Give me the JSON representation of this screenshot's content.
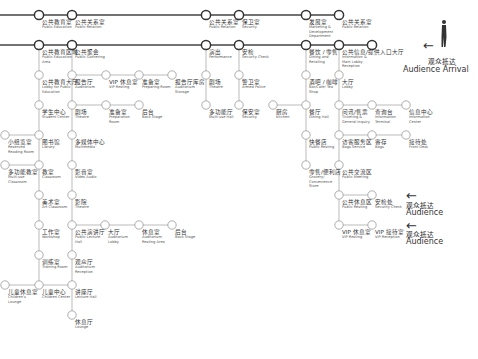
{
  "colors": {
    "main_line": "#444444",
    "branch_line": "#aaaaaa",
    "node_fill": "#ffffff"
  },
  "main_lines": [
    {
      "y": 15,
      "x1": 0,
      "x2": 339
    },
    {
      "y": 45,
      "x1": 0,
      "x2": 372
    }
  ],
  "branch_lines": [
    {
      "x1": 39,
      "y1": 45,
      "x2": 39,
      "y2": 285
    },
    {
      "x1": 72,
      "y1": 45,
      "x2": 72,
      "y2": 315
    },
    {
      "x1": 72,
      "y1": 75,
      "x2": 172,
      "y2": 75
    },
    {
      "x1": 72,
      "y1": 105,
      "x2": 139,
      "y2": 105
    },
    {
      "x1": 5,
      "y1": 135,
      "x2": 39,
      "y2": 135
    },
    {
      "x1": 5,
      "y1": 165,
      "x2": 39,
      "y2": 165
    },
    {
      "x1": 5,
      "y1": 285,
      "x2": 72,
      "y2": 285
    },
    {
      "x1": 72,
      "y1": 225,
      "x2": 172,
      "y2": 225
    },
    {
      "x1": 206,
      "y1": 45,
      "x2": 206,
      "y2": 105
    },
    {
      "x1": 239,
      "y1": 45,
      "x2": 239,
      "y2": 105
    },
    {
      "x1": 273,
      "y1": 105,
      "x2": 306,
      "y2": 105
    },
    {
      "x1": 306,
      "y1": 45,
      "x2": 306,
      "y2": 165
    },
    {
      "x1": 339,
      "y1": 45,
      "x2": 339,
      "y2": 225
    },
    {
      "x1": 339,
      "y1": 105,
      "x2": 406,
      "y2": 105
    },
    {
      "x1": 339,
      "y1": 135,
      "x2": 406,
      "y2": 135
    },
    {
      "x1": 339,
      "y1": 195,
      "x2": 372,
      "y2": 195
    },
    {
      "x1": 339,
      "y1": 225,
      "x2": 372,
      "y2": 225
    }
  ],
  "main_nodes": [
    {
      "x": 39,
      "y": 15
    },
    {
      "x": 72,
      "y": 15
    },
    {
      "x": 206,
      "y": 15
    },
    {
      "x": 239,
      "y": 15
    },
    {
      "x": 306,
      "y": 15
    },
    {
      "x": 339,
      "y": 15
    },
    {
      "x": 39,
      "y": 45
    },
    {
      "x": 72,
      "y": 45
    },
    {
      "x": 206,
      "y": 45
    },
    {
      "x": 239,
      "y": 45
    },
    {
      "x": 306,
      "y": 45
    },
    {
      "x": 339,
      "y": 45
    },
    {
      "x": 372,
      "y": 45
    }
  ],
  "nodes": [
    {
      "x": 39,
      "y": 75
    },
    {
      "x": 39,
      "y": 105
    },
    {
      "x": 39,
      "y": 135
    },
    {
      "x": 39,
      "y": 165
    },
    {
      "x": 39,
      "y": 195
    },
    {
      "x": 39,
      "y": 225
    },
    {
      "x": 39,
      "y": 255
    },
    {
      "x": 39,
      "y": 285
    },
    {
      "x": 72,
      "y": 75
    },
    {
      "x": 72,
      "y": 105
    },
    {
      "x": 72,
      "y": 135
    },
    {
      "x": 72,
      "y": 165
    },
    {
      "x": 72,
      "y": 195
    },
    {
      "x": 72,
      "y": 225
    },
    {
      "x": 72,
      "y": 255
    },
    {
      "x": 72,
      "y": 285
    },
    {
      "x": 72,
      "y": 315
    },
    {
      "x": 106,
      "y": 75
    },
    {
      "x": 139,
      "y": 75
    },
    {
      "x": 172,
      "y": 75
    },
    {
      "x": 106,
      "y": 105
    },
    {
      "x": 139,
      "y": 105
    },
    {
      "x": 5,
      "y": 135
    },
    {
      "x": 5,
      "y": 165
    },
    {
      "x": 5,
      "y": 285
    },
    {
      "x": 105,
      "y": 225
    },
    {
      "x": 139,
      "y": 225
    },
    {
      "x": 172,
      "y": 225
    },
    {
      "x": 206,
      "y": 75
    },
    {
      "x": 206,
      "y": 105
    },
    {
      "x": 239,
      "y": 75
    },
    {
      "x": 239,
      "y": 105
    },
    {
      "x": 273,
      "y": 105
    },
    {
      "x": 306,
      "y": 75
    },
    {
      "x": 306,
      "y": 105
    },
    {
      "x": 306,
      "y": 135
    },
    {
      "x": 306,
      "y": 165
    },
    {
      "x": 339,
      "y": 75
    },
    {
      "x": 339,
      "y": 105
    },
    {
      "x": 339,
      "y": 135
    },
    {
      "x": 339,
      "y": 165
    },
    {
      "x": 339,
      "y": 195
    },
    {
      "x": 339,
      "y": 225
    },
    {
      "x": 372,
      "y": 105
    },
    {
      "x": 406,
      "y": 105
    },
    {
      "x": 372,
      "y": 135
    },
    {
      "x": 406,
      "y": 135
    },
    {
      "x": 372,
      "y": 195
    },
    {
      "x": 372,
      "y": 225
    }
  ],
  "labels": [
    {
      "x": 42,
      "y": 19,
      "zh": "公共教育室",
      "en": "Public Education"
    },
    {
      "x": 75,
      "y": 19,
      "zh": "公共关系室",
      "en": "Public Relation"
    },
    {
      "x": 209,
      "y": 19,
      "zh": "公共关系室",
      "en": "Public Relation"
    },
    {
      "x": 242,
      "y": 19,
      "zh": "保卫室",
      "en": "Security"
    },
    {
      "x": 309,
      "y": 19,
      "zh": "发展室",
      "en": "Marketing & Development Department"
    },
    {
      "x": 342,
      "y": 19,
      "zh": "公共关系室",
      "en": "Public Relation"
    },
    {
      "x": 42,
      "y": 49,
      "zh": "公共教育区域",
      "en": "Public Education Area"
    },
    {
      "x": 75,
      "y": 49,
      "zh": "公共聚会",
      "en": "Public Gathering"
    },
    {
      "x": 209,
      "y": 49,
      "zh": "演出",
      "en": "Performance"
    },
    {
      "x": 242,
      "y": 49,
      "zh": "安检",
      "en": "Security Check"
    },
    {
      "x": 309,
      "y": 49,
      "zh": "餐饮 / 零售",
      "en": "Dining and Retailing"
    },
    {
      "x": 342,
      "y": 49,
      "zh": "公共信息/提供入口大厅",
      "en": "Information & Main Lobby Reception"
    },
    {
      "x": 42,
      "y": 79,
      "zh": "公共教育大厅",
      "en": "Lobby for Public Education"
    },
    {
      "x": 75,
      "y": 79,
      "zh": "报告厅",
      "en": "Auditorium"
    },
    {
      "x": 109,
      "y": 79,
      "zh": "VIP 休息室",
      "en": "VIP Resting"
    },
    {
      "x": 142,
      "y": 79,
      "zh": "准备室",
      "en": "Preparing Room"
    },
    {
      "x": 175,
      "y": 79,
      "zh": "报告厅库房",
      "en": "Auditorium Storage"
    },
    {
      "x": 209,
      "y": 79,
      "zh": "剧场",
      "en": "Theatre"
    },
    {
      "x": 242,
      "y": 79,
      "zh": "警卫室",
      "en": "Armed Police"
    },
    {
      "x": 309,
      "y": 79,
      "zh": "酒吧 / 咖啡",
      "en": "Bar/Cafe/ Tea Shop"
    },
    {
      "x": 342,
      "y": 79,
      "zh": "大厅",
      "en": "Lobby"
    },
    {
      "x": 42,
      "y": 109,
      "zh": "学生中心",
      "en": "Student Center"
    },
    {
      "x": 75,
      "y": 109,
      "zh": "剧场",
      "en": "Theatre"
    },
    {
      "x": 109,
      "y": 109,
      "zh": "准备室",
      "en": "Preparation Room"
    },
    {
      "x": 142,
      "y": 109,
      "zh": "后台",
      "en": "Back Stage"
    },
    {
      "x": 209,
      "y": 109,
      "zh": "多功能厅",
      "en": "Multi-use Hall"
    },
    {
      "x": 242,
      "y": 109,
      "zh": "保安室",
      "en": "Security"
    },
    {
      "x": 276,
      "y": 109,
      "zh": "厨房",
      "en": "Kitchen"
    },
    {
      "x": 309,
      "y": 109,
      "zh": "餐厅",
      "en": "Dining Hall"
    },
    {
      "x": 342,
      "y": 109,
      "zh": "问讯/售票",
      "en": "Ticketing & General Inquiry"
    },
    {
      "x": 375,
      "y": 109,
      "zh": "查询台",
      "en": "Information Terminal"
    },
    {
      "x": 409,
      "y": 109,
      "zh": "信息中心",
      "en": "Information Center"
    },
    {
      "x": 8,
      "y": 139,
      "zh": "小组览室",
      "en": "Reserved Reading Room"
    },
    {
      "x": 42,
      "y": 139,
      "zh": "图书馆",
      "en": "Library"
    },
    {
      "x": 75,
      "y": 139,
      "zh": "多媒体中心",
      "en": "Multimedia"
    },
    {
      "x": 309,
      "y": 139,
      "zh": "快餐店",
      "en": "Public Resting"
    },
    {
      "x": 342,
      "y": 139,
      "zh": "访客服务区",
      "en": "Bags Service"
    },
    {
      "x": 375,
      "y": 139,
      "zh": "寄存",
      "en": "Bags"
    },
    {
      "x": 409,
      "y": 139,
      "zh": "接待处",
      "en": "Front Desk"
    },
    {
      "x": 8,
      "y": 169,
      "zh": "多功能教室",
      "en": "Multi-use Classroom"
    },
    {
      "x": 42,
      "y": 169,
      "zh": "教室",
      "en": "Classroom"
    },
    {
      "x": 75,
      "y": 169,
      "zh": "影音室",
      "en": "Video Audio"
    },
    {
      "x": 309,
      "y": 169,
      "zh": "零售/便利店",
      "en": "Grocery/ Convenience Store"
    },
    {
      "x": 342,
      "y": 169,
      "zh": "公共交流区",
      "en": "Public Meeting"
    },
    {
      "x": 42,
      "y": 199,
      "zh": "美术室",
      "en": "Art Classroom"
    },
    {
      "x": 75,
      "y": 199,
      "zh": "影院",
      "en": "Theatre"
    },
    {
      "x": 342,
      "y": 199,
      "zh": "公共休息区",
      "en": "Public Resting"
    },
    {
      "x": 375,
      "y": 199,
      "zh": "安检处",
      "en": "Security Check"
    },
    {
      "x": 42,
      "y": 229,
      "zh": "工作室",
      "en": "Workshop"
    },
    {
      "x": 75,
      "y": 229,
      "zh": "公共演讲厅",
      "en": "Public Lecture Hall"
    },
    {
      "x": 108,
      "y": 229,
      "zh": "大厅",
      "en": "Auditorium Lobby"
    },
    {
      "x": 142,
      "y": 229,
      "zh": "休息室",
      "en": "Auditorium Resting Area"
    },
    {
      "x": 175,
      "y": 229,
      "zh": "后台",
      "en": "Back Stage"
    },
    {
      "x": 342,
      "y": 229,
      "zh": "VIP 休息室",
      "en": "VIP Resting"
    },
    {
      "x": 375,
      "y": 229,
      "zh": "VIP 接待室",
      "en": "VIP Reception"
    },
    {
      "x": 42,
      "y": 259,
      "zh": "训练室",
      "en": "Training Room"
    },
    {
      "x": 75,
      "y": 259,
      "zh": "观众厅",
      "en": "Auditorium Reception"
    },
    {
      "x": 8,
      "y": 289,
      "zh": "儿童休息室",
      "en": "Children's Lounge"
    },
    {
      "x": 42,
      "y": 289,
      "zh": "儿童中心",
      "en": "Children Center"
    },
    {
      "x": 75,
      "y": 289,
      "zh": "讲座厅",
      "en": "Lecture Hall"
    },
    {
      "x": 75,
      "y": 319,
      "zh": "休息厅",
      "en": "Lounge"
    }
  ],
  "legend": [
    {
      "arrow": "←",
      "arrow_x": 423,
      "arrow_y": 38,
      "zh": "观众抵达",
      "zh_x": 428,
      "zh_y": 56,
      "en": "Audience Arrival",
      "en_x": 403,
      "en_y": 65
    },
    {
      "arrow": "←",
      "arrow_x": 406,
      "arrow_y": 188,
      "zh": "观众抵达",
      "zh_x": 406,
      "zh_y": 200,
      "en": "Audience",
      "en_x": 406,
      "en_y": 208
    },
    {
      "arrow": "←",
      "arrow_x": 406,
      "arrow_y": 218,
      "zh": "观众抵达",
      "zh_x": 406,
      "zh_y": 229,
      "en": "Audience",
      "en_x": 406,
      "en_y": 237
    }
  ],
  "person_icon": {
    "x": 440,
    "y": 20
  }
}
